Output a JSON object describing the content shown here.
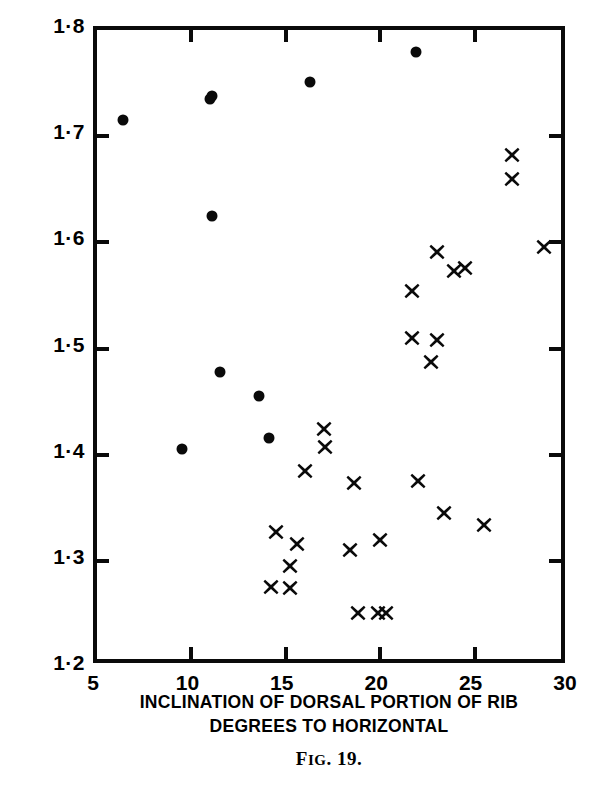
{
  "chart_data": {
    "type": "scatter",
    "title": "",
    "caption": "Fig. 19.",
    "caption_lead": "F",
    "caption_rest": "IG",
    "caption_tail": ". 19.",
    "xlabel_line1": "INCLINATION OF DORSAL PORTION OF RIB",
    "xlabel_line2": "DEGREES TO HORIZONTAL",
    "ylabel": "BREADTH OF CHEST PER UNIT HEIGHT",
    "xlim": [
      5,
      30
    ],
    "ylim": [
      1.2,
      1.8
    ],
    "xticks": [
      5,
      10,
      15,
      20,
      25,
      30
    ],
    "yticks": [
      1.2,
      1.3,
      1.4,
      1.5,
      1.6,
      1.7,
      1.8
    ],
    "xtick_labels": [
      "5",
      "10",
      "15",
      "20",
      "25",
      "30"
    ],
    "ytick_labels": [
      "1·2",
      "1·3",
      "1·4",
      "1·5",
      "1·6",
      "1·7",
      "1·8"
    ],
    "grid": false,
    "legend_position": "none",
    "marker_color": "#0a0a0a",
    "axis_color": "#0a0a0a",
    "background": "#ffffff",
    "series": [
      {
        "name": "filled-circle-group",
        "marker": "circle",
        "points": [
          [
            6.4,
            1.715
          ],
          [
            11.1,
            1.738
          ],
          [
            11.0,
            1.735
          ],
          [
            11.1,
            1.625
          ],
          [
            11.5,
            1.478
          ],
          [
            13.6,
            1.455
          ],
          [
            14.1,
            1.416
          ],
          [
            9.5,
            1.405
          ],
          [
            16.3,
            1.751
          ],
          [
            21.9,
            1.779
          ]
        ]
      },
      {
        "name": "cross-group",
        "marker": "cross",
        "points": [
          [
            27.4,
            1.843
          ],
          [
            27.0,
            1.682
          ],
          [
            27.0,
            1.66
          ],
          [
            28.7,
            1.596
          ],
          [
            23.0,
            1.591
          ],
          [
            23.9,
            1.573
          ],
          [
            24.5,
            1.576
          ],
          [
            21.7,
            1.554
          ],
          [
            21.7,
            1.51
          ],
          [
            23.0,
            1.508
          ],
          [
            22.7,
            1.487
          ],
          [
            17.0,
            1.424
          ],
          [
            17.1,
            1.407
          ],
          [
            16.0,
            1.385
          ],
          [
            18.6,
            1.373
          ],
          [
            22.0,
            1.375
          ],
          [
            23.4,
            1.345
          ],
          [
            25.5,
            1.334
          ],
          [
            14.5,
            1.327
          ],
          [
            15.6,
            1.316
          ],
          [
            20.0,
            1.32
          ],
          [
            18.4,
            1.31
          ],
          [
            15.2,
            1.295
          ],
          [
            14.2,
            1.275
          ],
          [
            15.2,
            1.274
          ],
          [
            18.8,
            1.251
          ],
          [
            19.9,
            1.251
          ],
          [
            20.3,
            1.251
          ]
        ]
      }
    ]
  }
}
